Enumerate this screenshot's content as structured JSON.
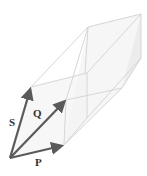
{
  "diagram": {
    "type": "parallelepiped-vectors",
    "vectors": [
      {
        "name": "P",
        "label": "P"
      },
      {
        "name": "Q",
        "label": "Q"
      },
      {
        "name": "S",
        "label": "S"
      }
    ],
    "colors": {
      "vector": "#5a5a5a",
      "box_edge": "#d8d8d8",
      "box_fill": "#f2f2f2",
      "label": "#333333"
    }
  }
}
